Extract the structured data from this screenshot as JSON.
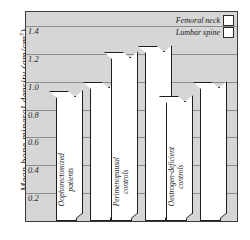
{
  "chart_data": {
    "type": "bar",
    "title": "",
    "subtitle": "",
    "xlabel": "",
    "ylabel": "Mean bone mineral density (gm/cm",
    "ylabel_exponent": "3",
    "ylabel_suffix": ")",
    "ylim": [
      0,
      1.5
    ],
    "yticks": [
      1.4,
      1.2,
      1.0,
      0.8,
      0.6,
      0.4,
      0.2
    ],
    "ytick_labels": [
      "1.4",
      "1.2",
      "1.0",
      "0.8",
      "0.6",
      "0.4",
      "0.2"
    ],
    "grid": true,
    "legend_position": "top-right",
    "categories": [
      "Oophorectomized patients",
      "Perimenopausal controls",
      "Oestrogen-deficient controls"
    ],
    "category_lines": [
      [
        "Oophorectomized",
        "patients"
      ],
      [
        "Perimenopausal",
        "controls"
      ],
      [
        "Oestrogen-deficient",
        "controls"
      ]
    ],
    "series": [
      {
        "name": "Femoral neck",
        "values": [
          0.9,
          1.18,
          0.86
        ]
      },
      {
        "name": "Lumbar spine",
        "values": [
          0.96,
          1.22,
          0.96
        ]
      }
    ]
  },
  "legend": {
    "items": [
      {
        "label": "Femoral neck"
      },
      {
        "label": "Lumbar spine"
      }
    ]
  },
  "colors": {
    "plot_background": "#d6d6d6",
    "bar_fill": "#ffffff",
    "bar_outline": "#1e1e1e",
    "gridline": "#8d8d8d",
    "frame": "#3a3a3a",
    "text": "#1a1a1a"
  }
}
